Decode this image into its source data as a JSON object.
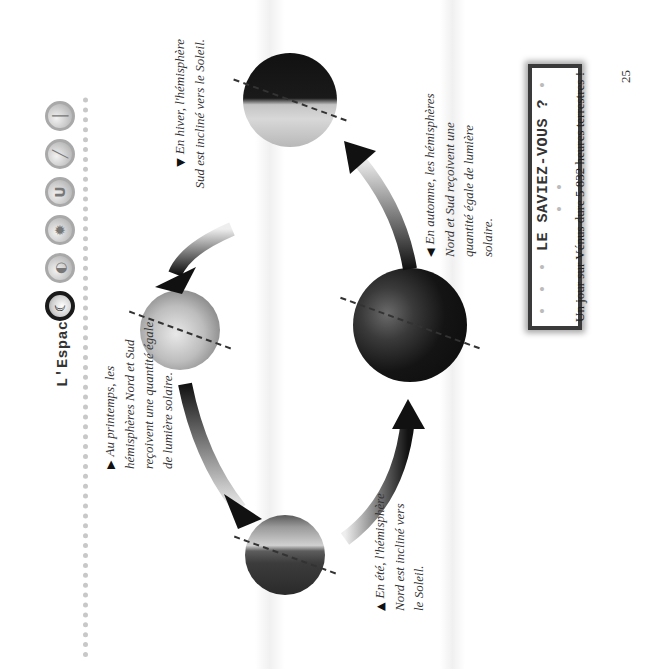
{
  "header": {
    "title": "L'Espace",
    "icons": [
      {
        "name": "moon-icon",
        "glyph": "☾",
        "active": true
      },
      {
        "name": "planet-icon",
        "glyph": "◐",
        "active": false
      },
      {
        "name": "star-icon",
        "glyph": "✹",
        "active": false
      },
      {
        "name": "magnet-icon",
        "glyph": "U",
        "active": false
      },
      {
        "name": "telescope-icon",
        "glyph": "╱",
        "active": false
      },
      {
        "name": "thermometer-icon",
        "glyph": "│",
        "active": false
      }
    ]
  },
  "diagram": {
    "seasons": [
      {
        "id": "winter",
        "marker": "▼",
        "text": "En hiver, l'hémisphère Sud est incliné vers le Soleil."
      },
      {
        "id": "spring",
        "marker": "▶",
        "text": "Au printemps, les hémisphères Nord et Sud reçoivent une quantité égale de lumière solaire."
      },
      {
        "id": "summer",
        "marker": "▲",
        "text": "En été, l'hémisphère Nord est incliné vers le Soleil."
      },
      {
        "id": "autumn",
        "marker": "◀",
        "text": "En automne, les hémisphères Nord et Sud reçoivent une quantité égale de lumière solaire."
      }
    ]
  },
  "fact_box": {
    "title": "LE SAVIEZ-VOUS ?",
    "leading_dots": "• • •",
    "trailing_dots": "• • •",
    "text": "Un jour sur Vénus dure 5 832 heures terrestres !"
  },
  "page_number": "25"
}
